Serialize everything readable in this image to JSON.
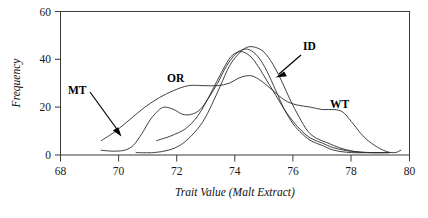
{
  "chart_data": {
    "type": "line",
    "title": "",
    "xlabel": "Trait Value (Malt Extract)",
    "ylabel": "Frequency",
    "xlim": [
      68,
      80
    ],
    "ylim": [
      0,
      60
    ],
    "xticks": [
      "68",
      "70",
      "72",
      "74",
      "76",
      "78",
      "80"
    ],
    "yticks": [
      "0",
      "20",
      "40",
      "60"
    ],
    "grid": false,
    "legend_position": "inline-annotations",
    "annotations": [
      {
        "label": "MT",
        "x": 69.6,
        "y": 26,
        "arrow_to_x": 70.3,
        "arrow_to_y": 7
      },
      {
        "label": "OR",
        "x": 71.9,
        "y": 33,
        "arrow_to_x": 72.4,
        "arrow_to_y": 29
      },
      {
        "label": "ID",
        "x": 76.4,
        "y": 49,
        "arrow_to_x": 75.2,
        "arrow_to_y": 37
      },
      {
        "label": "WT",
        "x": 77.6,
        "y": 21,
        "arrow_to_x": 77.6,
        "arrow_to_y": 21
      }
    ],
    "series": [
      {
        "name": "MT",
        "points": [
          [
            69.4,
            2
          ],
          [
            69.8,
            1.6
          ],
          [
            70.2,
            2
          ],
          [
            70.5,
            4
          ],
          [
            70.8,
            9
          ],
          [
            71.1,
            15
          ],
          [
            71.4,
            19
          ],
          [
            71.6,
            20
          ],
          [
            71.9,
            19
          ],
          [
            72.2,
            17
          ],
          [
            72.5,
            17
          ],
          [
            72.8,
            19
          ],
          [
            73.1,
            24
          ],
          [
            73.4,
            30
          ],
          [
            73.7,
            37
          ],
          [
            74.0,
            42
          ],
          [
            74.25,
            44
          ],
          [
            74.5,
            44
          ],
          [
            74.8,
            41
          ],
          [
            75.1,
            35
          ],
          [
            75.4,
            27
          ],
          [
            75.7,
            19
          ],
          [
            76.0,
            13
          ],
          [
            76.3,
            9
          ],
          [
            76.6,
            6
          ],
          [
            77.0,
            4
          ],
          [
            77.4,
            2
          ],
          [
            78.0,
            1
          ],
          [
            78.8,
            1
          ],
          [
            79.3,
            1
          ]
        ]
      },
      {
        "name": "OR",
        "points": [
          [
            69.4,
            6
          ],
          [
            69.9,
            10
          ],
          [
            70.4,
            15
          ],
          [
            70.9,
            20
          ],
          [
            71.4,
            24
          ],
          [
            71.9,
            27
          ],
          [
            72.4,
            29
          ],
          [
            72.9,
            29
          ],
          [
            73.4,
            29
          ],
          [
            73.8,
            30
          ],
          [
            74.1,
            32
          ],
          [
            74.35,
            33
          ],
          [
            74.6,
            33
          ],
          [
            74.9,
            31
          ],
          [
            75.3,
            27
          ],
          [
            75.7,
            23
          ],
          [
            76.1,
            21
          ],
          [
            76.6,
            20
          ],
          [
            77.0,
            19
          ],
          [
            77.4,
            19
          ],
          [
            77.7,
            18
          ],
          [
            78.0,
            14
          ],
          [
            78.4,
            8
          ],
          [
            78.8,
            4
          ],
          [
            79.2,
            1.5
          ],
          [
            79.5,
            1
          ],
          [
            79.7,
            2
          ]
        ]
      },
      {
        "name": "ID",
        "points": [
          [
            70.6,
            1
          ],
          [
            71.2,
            1
          ],
          [
            71.7,
            2
          ],
          [
            72.1,
            4
          ],
          [
            72.5,
            8
          ],
          [
            72.9,
            14
          ],
          [
            73.2,
            21
          ],
          [
            73.5,
            29
          ],
          [
            73.8,
            37
          ],
          [
            74.1,
            42
          ],
          [
            74.4,
            45
          ],
          [
            74.7,
            45
          ],
          [
            75.0,
            43
          ],
          [
            75.3,
            38
          ],
          [
            75.6,
            31
          ],
          [
            75.9,
            23
          ],
          [
            76.2,
            16
          ],
          [
            76.5,
            10
          ],
          [
            76.8,
            7
          ],
          [
            77.2,
            5
          ],
          [
            77.6,
            3
          ],
          [
            78.1,
            1.5
          ],
          [
            78.7,
            1
          ],
          [
            79.3,
            1
          ]
        ]
      },
      {
        "name": "WT",
        "points": [
          [
            71.3,
            6
          ],
          [
            71.8,
            8
          ],
          [
            72.3,
            11
          ],
          [
            72.7,
            16
          ],
          [
            73.0,
            22
          ],
          [
            73.3,
            29
          ],
          [
            73.6,
            36
          ],
          [
            73.85,
            41
          ],
          [
            74.1,
            43
          ],
          [
            74.3,
            43
          ],
          [
            74.55,
            41
          ],
          [
            74.8,
            37
          ],
          [
            75.1,
            31
          ],
          [
            75.4,
            25
          ],
          [
            75.7,
            19
          ],
          [
            76.0,
            14
          ],
          [
            76.3,
            10
          ],
          [
            76.6,
            7
          ],
          [
            77.0,
            5
          ],
          [
            77.4,
            3
          ],
          [
            78.0,
            1.5
          ],
          [
            78.6,
            1
          ],
          [
            79.3,
            1
          ]
        ]
      }
    ]
  },
  "axes": {
    "y_label": "Frequency",
    "x_label": "Trait Value (Malt Extract)"
  },
  "labels": {
    "mt": "MT",
    "or": "OR",
    "id": "ID",
    "wt": "WT"
  },
  "xticks": {
    "t0": "68",
    "t1": "70",
    "t2": "72",
    "t3": "74",
    "t4": "76",
    "t5": "78",
    "t6": "80"
  },
  "yticks": {
    "t0": "0",
    "t1": "20",
    "t2": "40",
    "t3": "60"
  }
}
